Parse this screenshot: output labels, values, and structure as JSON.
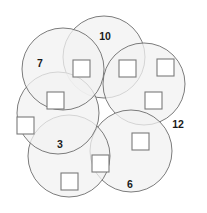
{
  "figure": {
    "background_color": "#ffffff",
    "circle_fill": "#f2f2f2",
    "circle_stroke": "#6d6d6d",
    "box_fill": "#ffffff",
    "box_stroke": "#7a7a7a",
    "label_color": "#1a1a1a",
    "width": 207,
    "height": 213
  },
  "circles": [
    {
      "id": "circle-top",
      "cx": 104,
      "cy": 57,
      "r": 41
    },
    {
      "id": "circle-upper-right",
      "cx": 144,
      "cy": 84,
      "r": 41
    },
    {
      "id": "circle-lower-right",
      "cx": 131,
      "cy": 151,
      "r": 41
    },
    {
      "id": "circle-bottom",
      "cx": 69,
      "cy": 156,
      "r": 41
    },
    {
      "id": "circle-lower-left",
      "cx": 58,
      "cy": 113,
      "r": 41
    },
    {
      "id": "circle-upper-left",
      "cx": 63,
      "cy": 69,
      "r": 41
    }
  ],
  "number_labels": [
    {
      "id": "label-10",
      "value": "10",
      "x": 105,
      "y": 37
    },
    {
      "id": "label-7",
      "value": "7",
      "x": 40,
      "y": 64
    },
    {
      "id": "label-12",
      "value": "12",
      "x": 178,
      "y": 125
    },
    {
      "id": "label-3",
      "value": "3",
      "x": 60,
      "y": 145
    },
    {
      "id": "label-6",
      "value": "6",
      "x": 130,
      "y": 185
    }
  ],
  "answer_boxes": [
    {
      "id": "box-top-left",
      "x": 73,
      "y": 60,
      "size": 17
    },
    {
      "id": "box-top-right",
      "x": 119,
      "y": 60,
      "size": 17
    },
    {
      "id": "box-far-right",
      "x": 157,
      "y": 59,
      "size": 17
    },
    {
      "id": "box-mid-left",
      "x": 47,
      "y": 92,
      "size": 17
    },
    {
      "id": "box-mid-right",
      "x": 145,
      "y": 92,
      "size": 17
    },
    {
      "id": "box-far-left",
      "x": 17,
      "y": 117,
      "size": 17
    },
    {
      "id": "box-right-lower",
      "x": 132,
      "y": 133,
      "size": 17
    },
    {
      "id": "box-bottom-mid",
      "x": 92,
      "y": 155,
      "size": 17
    },
    {
      "id": "box-bottom-left",
      "x": 61,
      "y": 173,
      "size": 17
    }
  ]
}
